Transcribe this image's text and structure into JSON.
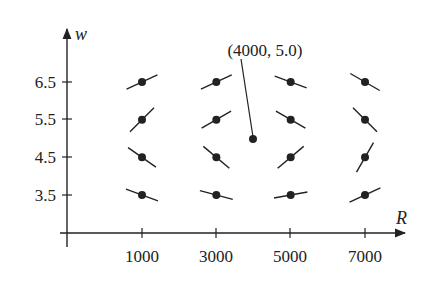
{
  "figure": {
    "type": "slope_field",
    "annotation": "(4000, 5.0)",
    "annotation_point": {
      "R": 4000,
      "w": 5.0
    },
    "colors": {
      "ink": "#222222",
      "background": "#ffffff"
    }
  },
  "axes": {
    "x": {
      "label": "R",
      "ticks": [
        1000,
        3000,
        5000,
        7000
      ],
      "tick_labels": [
        "1000",
        "3000",
        "5000",
        "7000"
      ]
    },
    "y": {
      "label": "w",
      "ticks": [
        3.5,
        4.5,
        5.5,
        6.5
      ],
      "tick_labels": [
        "3.5",
        "4.5",
        "5.5",
        "6.5"
      ]
    }
  },
  "chart_data": {
    "type": "scatter",
    "title": "",
    "xlabel": "R",
    "ylabel": "w",
    "x_ticks": [
      1000,
      3000,
      5000,
      7000
    ],
    "y_ticks": [
      3.5,
      4.5,
      5.5,
      6.5
    ],
    "grid": false,
    "points": [
      {
        "R": 1000,
        "w": 6.5,
        "slope_angle_deg": 25
      },
      {
        "R": 1000,
        "w": 5.5,
        "slope_angle_deg": 45
      },
      {
        "R": 1000,
        "w": 4.5,
        "slope_angle_deg": -35
      },
      {
        "R": 1000,
        "w": 3.5,
        "slope_angle_deg": -20
      },
      {
        "R": 3000,
        "w": 6.5,
        "slope_angle_deg": 25
      },
      {
        "R": 3000,
        "w": 5.5,
        "slope_angle_deg": 30
      },
      {
        "R": 3000,
        "w": 4.5,
        "slope_angle_deg": -40
      },
      {
        "R": 3000,
        "w": 3.5,
        "slope_angle_deg": -15
      },
      {
        "R": 5000,
        "w": 6.5,
        "slope_angle_deg": -20
      },
      {
        "R": 5000,
        "w": 5.5,
        "slope_angle_deg": -30
      },
      {
        "R": 5000,
        "w": 4.5,
        "slope_angle_deg": 40
      },
      {
        "R": 5000,
        "w": 3.5,
        "slope_angle_deg": 10
      },
      {
        "R": 7000,
        "w": 6.5,
        "slope_angle_deg": -30
      },
      {
        "R": 7000,
        "w": 5.5,
        "slope_angle_deg": -45
      },
      {
        "R": 7000,
        "w": 4.5,
        "slope_angle_deg": 60
      },
      {
        "R": 7000,
        "w": 3.5,
        "slope_angle_deg": 25
      }
    ],
    "equilibrium_point": {
      "R": 4000,
      "w": 5.0,
      "label": "(4000, 5.0)"
    }
  }
}
